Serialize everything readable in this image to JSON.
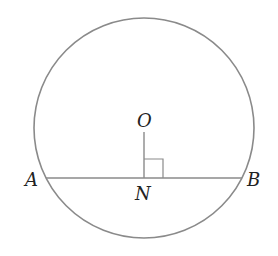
{
  "diagram": {
    "type": "geometry",
    "colors": {
      "stroke": "#8a8a8a",
      "label": "#222222",
      "background": "#ffffff"
    },
    "circle": {
      "cx": 144,
      "cy": 128,
      "r": 110
    },
    "chord": {
      "from": "A",
      "to": "B"
    },
    "perpendicular": {
      "from": "O",
      "to": "N",
      "right_angle_at": "N"
    },
    "labels": {
      "O": "O",
      "A": "A",
      "B": "B",
      "N": "N"
    }
  }
}
